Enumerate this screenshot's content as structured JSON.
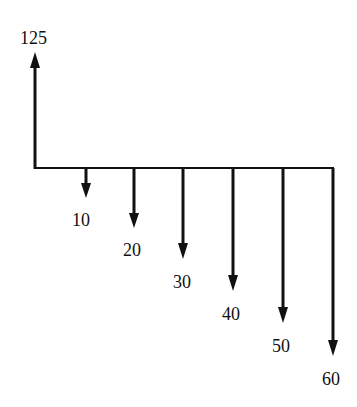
{
  "diagram": {
    "type": "cash-flow-diagram",
    "line_color": "#111111",
    "inflow": {
      "label": "125",
      "direction": "up"
    },
    "outflows": [
      {
        "label": "10",
        "direction": "down"
      },
      {
        "label": "20",
        "direction": "down"
      },
      {
        "label": "30",
        "direction": "down"
      },
      {
        "label": "40",
        "direction": "down"
      },
      {
        "label": "50",
        "direction": "down"
      },
      {
        "label": "60",
        "direction": "down"
      }
    ]
  }
}
